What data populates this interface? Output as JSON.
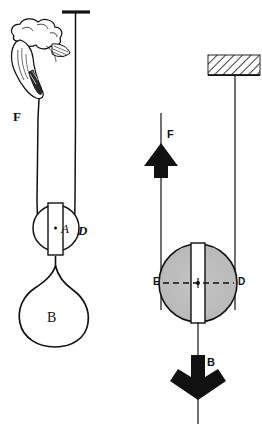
{
  "figure": {
    "colors": {
      "ink": "#111111",
      "pulley_fill": "#c0c0c0",
      "hatch_line": "#111111",
      "background": "#ffffff"
    }
  },
  "left_diagram": {
    "name": "pictorial-pulley-illustration",
    "support": {
      "type": "t-bar-bracket",
      "label": ""
    },
    "hand": {
      "icon": "hand-gripping-rope-icon",
      "description": "engraved hand with cuff gripping the rope"
    },
    "labels": {
      "force_applied": "F",
      "pulley_axle": "A",
      "pulley_rim": "D",
      "load": "B"
    },
    "load": {
      "shape": "balloon",
      "label": "B"
    }
  },
  "right_diagram": {
    "name": "schematic-pulley-free-body",
    "ceiling": {
      "type": "hatched-support-block",
      "hatching": "45-degree-diagonal"
    },
    "labels": {
      "force_up": "F",
      "diameter_left": "E",
      "diameter_right": "D",
      "force_down": "B"
    },
    "arrows": {
      "up_arrow": "arrow-up-icon",
      "down_arrow": "arrow-down-icon"
    },
    "pulley": {
      "fill": "#c0c0c0",
      "center_marker": "axle-dot",
      "diameter_line": "dashed"
    }
  }
}
